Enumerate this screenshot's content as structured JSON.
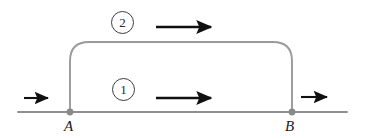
{
  "figure": {
    "type": "flow-branch-diagram",
    "background_color": "#ffffff"
  },
  "nodes": [
    {
      "id": "A",
      "label": "A",
      "x": 70,
      "y": 112
    },
    {
      "id": "B",
      "label": "B",
      "x": 292,
      "y": 112
    }
  ],
  "branches": [
    {
      "id": "1",
      "badge": "①",
      "number": "1",
      "path": "lower-straight",
      "badge_x": 123,
      "badge_y": 89
    },
    {
      "id": "2",
      "badge": "②",
      "number": "2",
      "path": "upper-curved",
      "badge_x": 123,
      "badge_y": 22
    }
  ],
  "arrows": [
    {
      "id": "inlet",
      "name": "inlet-flow-arrow",
      "x1": 24,
      "y1": 98,
      "x2": 51,
      "y2": 98,
      "direction": "right"
    },
    {
      "id": "upper",
      "name": "branch-2-flow-arrow",
      "x1": 156,
      "y1": 27,
      "x2": 216,
      "y2": 27,
      "direction": "right"
    },
    {
      "id": "lower",
      "name": "branch-1-flow-arrow",
      "x1": 156,
      "y1": 98,
      "x2": 216,
      "y2": 98,
      "direction": "right"
    },
    {
      "id": "outlet",
      "name": "outlet-flow-arrow",
      "x1": 301,
      "y1": 97,
      "x2": 331,
      "y2": 97,
      "direction": "right"
    }
  ],
  "geometry": {
    "main_line": {
      "x_start": 18,
      "x_end": 347,
      "y": 112
    },
    "bypass": {
      "left_x": 70,
      "right_x": 292,
      "top_y": 42,
      "corner_radius": 19
    },
    "node_dot_radius": 3.4
  },
  "colors": {
    "line": "#8f8f8f",
    "arrow": "#101010",
    "badge_border": "#3d3d3d",
    "text": "#1a1a1a",
    "node_dot": "#8a8a8a"
  }
}
